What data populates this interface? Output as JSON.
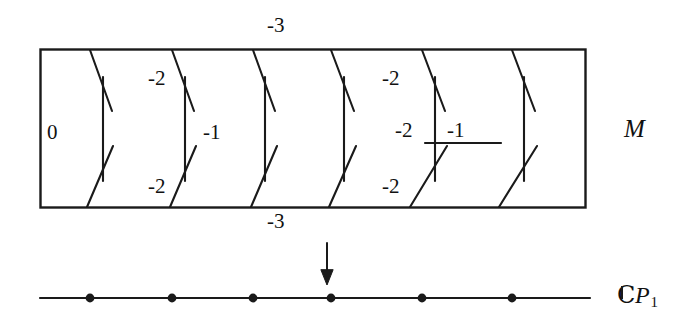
{
  "figure": {
    "title_total_space": "M",
    "title_base_space": {
      "field": "C",
      "symbol": "P",
      "subscript": "1"
    },
    "projection_arrow": "downward-arrow",
    "total_space_box": {
      "x": 40,
      "y": 49,
      "width": 545,
      "height": 158
    },
    "fibers": [
      {
        "id": "fiber-1",
        "top_x": 90,
        "mid_x": 103,
        "bot_x": 87,
        "self_intersection": -1,
        "label_upper": "-2",
        "label_lower": "-2"
      },
      {
        "id": "fiber-2",
        "top_x": 172,
        "mid_x": 185,
        "bot_x": 170,
        "self_intersection": -1,
        "label_upper": null,
        "label_lower": null
      },
      {
        "id": "fiber-3",
        "top_x": 253,
        "mid_x": 265,
        "bot_x": 251,
        "self_intersection": -1,
        "label_upper": null,
        "label_lower": null
      },
      {
        "id": "fiber-4",
        "top_x": 331,
        "mid_x": 344,
        "bot_x": 329,
        "self_intersection": -1,
        "label_upper": null,
        "label_lower": null
      },
      {
        "id": "fiber-5",
        "top_x": 422,
        "mid_x": 435,
        "bot_x": 410,
        "self_intersection": -1,
        "label_upper": "-2",
        "label_lower": "-2"
      },
      {
        "id": "fiber-6",
        "top_x": 512,
        "mid_x": 524,
        "bot_x": 499,
        "self_intersection": -1,
        "label_upper": null,
        "label_lower": null
      }
    ],
    "horizontal_component": {
      "x1": 425,
      "x2": 501,
      "y": 143,
      "label": "-1"
    },
    "labels": {
      "top_outside": "-3",
      "bottom_outside": "-3",
      "zero_section": "0",
      "fiber1_upper": "-2",
      "fiber1_lower": "-2",
      "fiber1_mid": "-1",
      "fiber5_upper": "-2",
      "fiber5_lower": "-2",
      "fiber5_mid": "-2",
      "horizontal_label": "-1"
    },
    "base_line": {
      "x1": 40,
      "x2": 590,
      "y": 298,
      "points": [
        {
          "x": 90
        },
        {
          "x": 172
        },
        {
          "x": 253
        },
        {
          "x": 331
        },
        {
          "x": 422
        },
        {
          "x": 512
        }
      ]
    },
    "colors": {
      "ink": "#1a1a1a",
      "background": "#ffffff"
    }
  }
}
